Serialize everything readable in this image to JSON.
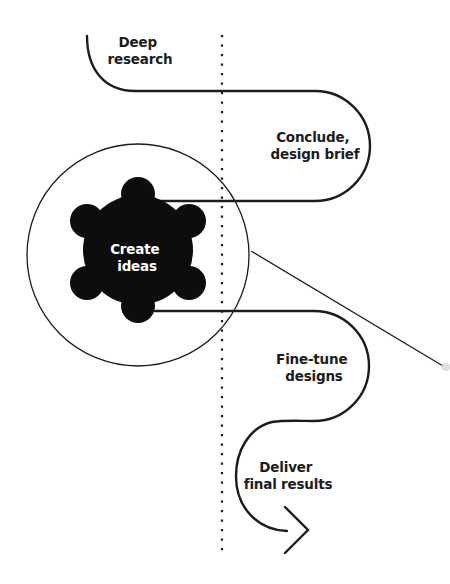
{
  "diagram": {
    "colors": {
      "background": "#ffffff",
      "stroke": "#1c1c1c",
      "blob_fill": "#0d0d0d",
      "blob_text": "#ffffff",
      "divider": "#1c1c1c"
    },
    "steps": [
      {
        "id": "deep-research",
        "line1": "Deep",
        "line2": "research"
      },
      {
        "id": "conclude",
        "line1": "Conclude,",
        "line2": "design brief"
      },
      {
        "id": "create-ideas",
        "line1": "Create",
        "line2": "ideas"
      },
      {
        "id": "fine-tune",
        "line1": "Fine-tune",
        "line2": "designs"
      },
      {
        "id": "deliver",
        "line1": "Deliver",
        "line2": "final results"
      }
    ],
    "divider": {
      "style": "dotted-vertical"
    },
    "magnifier": {
      "shape": "circle-with-pointer-line"
    },
    "end_marker": {
      "icon": "chevron-right-arrowhead"
    }
  }
}
